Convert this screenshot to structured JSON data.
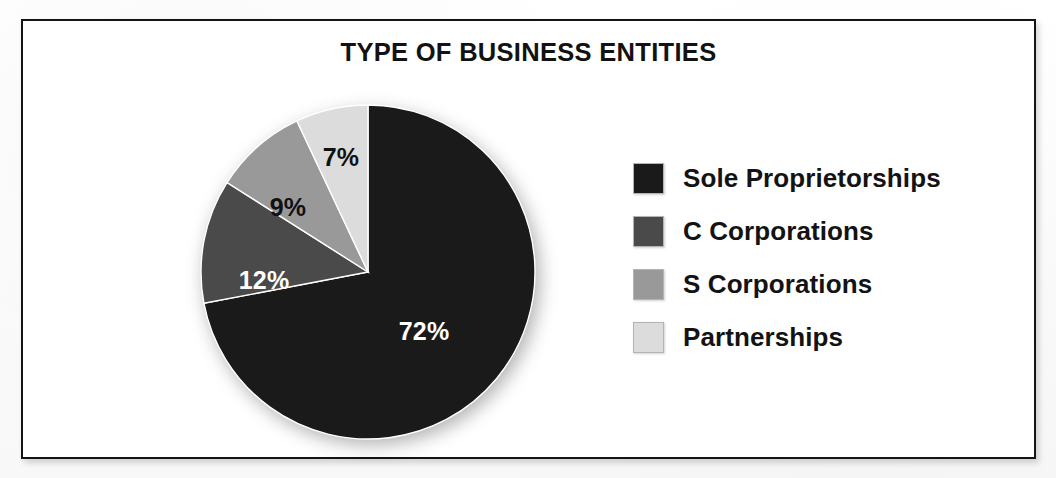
{
  "frame": {
    "border_color": "#141414"
  },
  "chart_data": {
    "type": "pie",
    "title": "TYPE OF BUSINESS ENTITIES",
    "xlabel": "",
    "ylabel": "",
    "legend_position": "right",
    "grid": false,
    "categories": [
      "Sole Proprietorships",
      "C Corporations",
      "S Corporations",
      "Partnerships"
    ],
    "values": [
      72,
      12,
      9,
      7
    ],
    "value_labels": [
      "72%",
      "12%",
      "9%",
      "7%"
    ],
    "colors": [
      "#1a1a1a",
      "#4a4a4a",
      "#999999",
      "#dcdcdc"
    ],
    "label_text_colors": [
      "#ffffff",
      "#ffffff",
      "#111111",
      "#111111"
    ],
    "slices": [
      {
        "name": "Sole Proprietorships",
        "value": 72,
        "label": "72%",
        "color": "#1a1a1a",
        "label_color": "#ffffff",
        "start_angle": 0,
        "end_angle": 259.2,
        "label_x": 246,
        "label_y": 250
      },
      {
        "name": "C Corporations",
        "value": 12,
        "label": "12%",
        "color": "#4a4a4a",
        "label_color": "#ffffff",
        "start_angle": 259.2,
        "end_angle": 302.4,
        "label_x": 86,
        "label_y": 199
      },
      {
        "name": "S Corporations",
        "value": 9,
        "label": "9%",
        "color": "#999999",
        "label_color": "#111111",
        "start_angle": 302.4,
        "end_angle": 334.8,
        "label_x": 110,
        "label_y": 126
      },
      {
        "name": "Partnerships",
        "value": 7,
        "label": "7%",
        "color": "#dcdcdc",
        "label_color": "#111111",
        "start_angle": 334.8,
        "end_angle": 360,
        "label_x": 163,
        "label_y": 76
      }
    ]
  },
  "legend": {
    "items": [
      {
        "label": "Sole Proprietorships",
        "color": "#1a1a1a"
      },
      {
        "label": "C Corporations",
        "color": "#4a4a4a"
      },
      {
        "label": "S Corporations",
        "color": "#999999"
      },
      {
        "label": "Partnerships",
        "color": "#dcdcdc"
      }
    ]
  }
}
